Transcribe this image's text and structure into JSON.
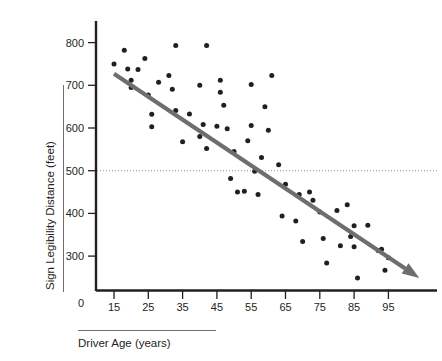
{
  "chart_data": {
    "type": "scatter",
    "title": "",
    "xlabel": "Driver Age (years)",
    "ylabel": "Sign Legibility Distance (feet)",
    "xlim": [
      5,
      105
    ],
    "ylim": [
      200,
      840
    ],
    "grid": false,
    "legend": "none",
    "x_ticks": [
      15,
      25,
      35,
      45,
      55,
      65,
      75,
      85,
      95
    ],
    "x_tick_labels": [
      "15",
      "25",
      "35",
      "45",
      "55",
      "65",
      "75",
      "85",
      "95"
    ],
    "y_ticks": [
      300,
      400,
      500,
      600,
      700,
      800
    ],
    "y_tick_labels": [
      "300",
      "400",
      "500",
      "600",
      "700",
      "800"
    ],
    "origin_label": "0",
    "reference_line": {
      "orientation": "horizontal",
      "value": 500,
      "style": "dotted",
      "color": "#9a8fa0"
    },
    "series": [
      {
        "name": "Drivers",
        "marker": "circle",
        "color": "#231f20",
        "points": [
          [
            15,
            750
          ],
          [
            18,
            782
          ],
          [
            19,
            738
          ],
          [
            20,
            695
          ],
          [
            20,
            712
          ],
          [
            22,
            737
          ],
          [
            24,
            763
          ],
          [
            25,
            677
          ],
          [
            26,
            632
          ],
          [
            26,
            603
          ],
          [
            28,
            707
          ],
          [
            31,
            723
          ],
          [
            32,
            691
          ],
          [
            33,
            793
          ],
          [
            33,
            641
          ],
          [
            35,
            568
          ],
          [
            37,
            633
          ],
          [
            40,
            700
          ],
          [
            40,
            580
          ],
          [
            41,
            608
          ],
          [
            42,
            793
          ],
          [
            42,
            552
          ],
          [
            45,
            604
          ],
          [
            46,
            712
          ],
          [
            46,
            684
          ],
          [
            47,
            653
          ],
          [
            48,
            598
          ],
          [
            49,
            482
          ],
          [
            50,
            545
          ],
          [
            51,
            450
          ],
          [
            53,
            452
          ],
          [
            54,
            570
          ],
          [
            55,
            702
          ],
          [
            55,
            606
          ],
          [
            56,
            499
          ],
          [
            57,
            444
          ],
          [
            58,
            531
          ],
          [
            59,
            650
          ],
          [
            60,
            595
          ],
          [
            61,
            723
          ],
          [
            63,
            514
          ],
          [
            64,
            394
          ],
          [
            65,
            468
          ],
          [
            68,
            382
          ],
          [
            69,
            444
          ],
          [
            70,
            334
          ],
          [
            72,
            450
          ],
          [
            73,
            431
          ],
          [
            75,
            403
          ],
          [
            76,
            341
          ],
          [
            77,
            284
          ],
          [
            80,
            407
          ],
          [
            81,
            324
          ],
          [
            83,
            420
          ],
          [
            84,
            346
          ],
          [
            85,
            371
          ],
          [
            85,
            322
          ],
          [
            86,
            249
          ],
          [
            89,
            372
          ],
          [
            92,
            313
          ],
          [
            93,
            316
          ],
          [
            94,
            267
          ],
          [
            95,
            296
          ]
        ]
      }
    ],
    "trendline": {
      "label": "negative linear trend",
      "color": "#6d6e71",
      "arrow": true,
      "start": [
        15,
        727
      ],
      "end": [
        104,
        249
      ]
    }
  },
  "axes": {
    "y_axis_rule_label": "Sign Legibility Distance (feet)",
    "x_axis_rule_label": "Driver Age (years)"
  }
}
